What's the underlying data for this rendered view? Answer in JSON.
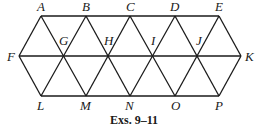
{
  "diagram": {
    "caption": "Exs. 9–11",
    "points": {
      "A": {
        "label": "A",
        "x": 41,
        "y": 16
      },
      "B": {
        "label": "B",
        "x": 86,
        "y": 16
      },
      "C": {
        "label": "C",
        "x": 130,
        "y": 16
      },
      "D": {
        "label": "D",
        "x": 175,
        "y": 16
      },
      "E": {
        "label": "E",
        "x": 219,
        "y": 16
      },
      "F": {
        "label": "F",
        "x": 19,
        "y": 56
      },
      "G": {
        "label": "G",
        "x": 63,
        "y": 56
      },
      "H": {
        "label": "H",
        "x": 108,
        "y": 56
      },
      "I": {
        "label": "I",
        "x": 152,
        "y": 56
      },
      "J": {
        "label": "J",
        "x": 197,
        "y": 56
      },
      "K": {
        "label": "K",
        "x": 241,
        "y": 56
      },
      "L": {
        "label": "L",
        "x": 41,
        "y": 96
      },
      "M": {
        "label": "M",
        "x": 86,
        "y": 96
      },
      "N": {
        "label": "N",
        "x": 130,
        "y": 96
      },
      "O": {
        "label": "O",
        "x": 175,
        "y": 96
      },
      "P": {
        "label": "P",
        "x": 219,
        "y": 96
      }
    },
    "segments": [
      [
        "A",
        "E"
      ],
      [
        "F",
        "K"
      ],
      [
        "L",
        "P"
      ],
      [
        "F",
        "A"
      ],
      [
        "F",
        "L"
      ],
      [
        "E",
        "K"
      ],
      [
        "P",
        "K"
      ],
      [
        "A",
        "N"
      ],
      [
        "B",
        "O"
      ],
      [
        "C",
        "P"
      ],
      [
        "B",
        "L"
      ],
      [
        "C",
        "M"
      ],
      [
        "D",
        "N"
      ],
      [
        "E",
        "O"
      ],
      [
        "A",
        "M"
      ],
      [
        "D",
        "L"
      ]
    ]
  }
}
